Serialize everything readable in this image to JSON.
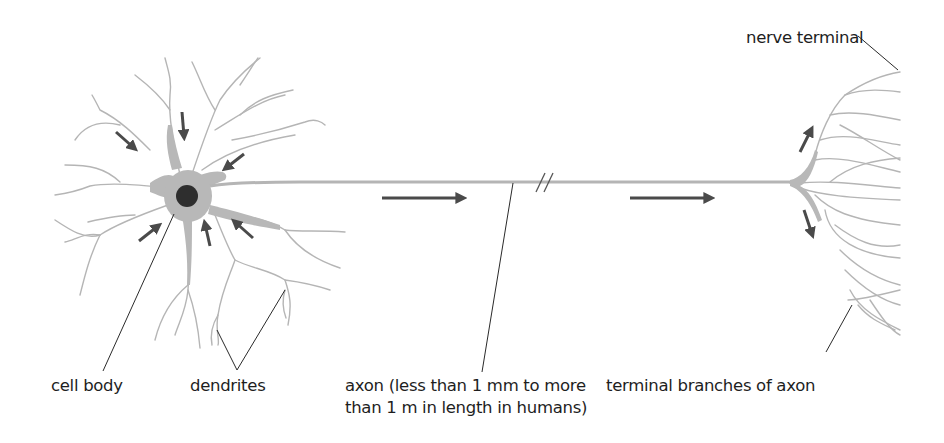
{
  "diagram": {
    "colors": {
      "neuron_fill": "#b8b8b8",
      "neuron_stroke": "#b0b0b0",
      "nucleus": "#2e2e2e",
      "arrow": "#4a4a4a",
      "leader_line": "#2a2a2a",
      "text": "#1e1e1e"
    },
    "labels": {
      "cell_body": "cell body",
      "dendrites": "dendrites",
      "axon_line1": "axon (less than 1 mm to more",
      "axon_line2": "than 1 m in length in humans)",
      "terminal_branches": "terminal branches of axon",
      "nerve_terminal": "nerve terminal"
    },
    "arrows": {
      "incoming_to_cell_body": 6,
      "along_axon": 2,
      "outgoing_at_terminal": 2
    },
    "axon_break_symbol": "//"
  }
}
